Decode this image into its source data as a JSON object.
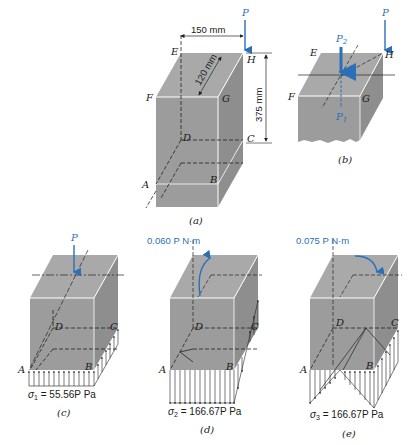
{
  "figure": {
    "colors": {
      "block_front": "#9a9a9a",
      "block_top": "#a8a8a8",
      "block_side": "#8f8f8f",
      "edge_white": "#ffffff",
      "dash": "#222222",
      "load_blue": "#2a6fb8"
    },
    "panel_a": {
      "caption": "(a)",
      "load_label": "P",
      "dim_width": "150 mm",
      "dim_depth": "120 mm",
      "dim_height": "375 mm",
      "corners": {
        "E": "E",
        "H": "H",
        "F": "F",
        "G": "G",
        "D": "D",
        "C": "C",
        "A": "A",
        "B": "B"
      }
    },
    "panel_b": {
      "caption": "(b)",
      "load_label": "P",
      "p2_label": "P",
      "p2_sub": "2",
      "p1_label": "P",
      "p1_sub": "1",
      "corners": {
        "E": "E",
        "H": "H",
        "F": "F",
        "G": "G"
      }
    },
    "panel_c": {
      "caption": "(c)",
      "load_label": "P",
      "corners": {
        "D": "D",
        "C": "C",
        "A": "A",
        "B": "B"
      },
      "stress_symbol": "σ",
      "stress_sub": "1",
      "stress_value": " = 55.56P Pa"
    },
    "panel_d": {
      "caption": "(d)",
      "moment_label": "0.060 P N·m",
      "corners": {
        "D": "D",
        "C": "C",
        "A": "A",
        "B": "B"
      },
      "stress_symbol": "σ",
      "stress_sub": "2",
      "stress_value": " = 166.67P Pa"
    },
    "panel_e": {
      "caption": "(e)",
      "moment_label": "0.075 P N·m",
      "corners": {
        "D": "D",
        "C": "C",
        "A": "A",
        "B": "B"
      },
      "stress_symbol": "σ",
      "stress_sub": "3",
      "stress_value": " = 166.67P Pa"
    }
  }
}
